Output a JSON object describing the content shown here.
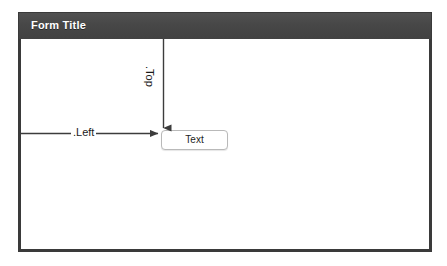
{
  "diagram": {
    "title": "Form Title",
    "form": {
      "title_bar_label": "Form Title",
      "title_bar_color": "#474747",
      "border_color": "#3a3a3a",
      "background_color": "#ffffff"
    },
    "controls": [
      {
        "name": "text-control",
        "label": "Text",
        "border_color": "#b9b9b9"
      }
    ],
    "annotations": [
      {
        "name": "left-annotation",
        "label": ".Left",
        "direction": "horizontal",
        "description": "Distance from the left edge of the form to the left edge of the Text control"
      },
      {
        "name": "top-annotation",
        "label": ".Top",
        "direction": "vertical",
        "description": "Distance from the top edge of the form client area to the top edge of the Text control"
      }
    ],
    "line_color": "#3c3c3c"
  }
}
